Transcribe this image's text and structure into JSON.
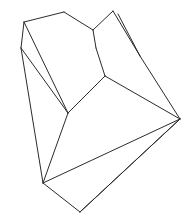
{
  "figure": {
    "type": "line-art",
    "canvas": {
      "width": 191,
      "height": 220,
      "background": "#ffffff"
    },
    "style": {
      "stroke_color": "#2b2b2b",
      "stroke_width": 1,
      "fill_color": "#ffffff",
      "has_text_labels": false,
      "has_shading": false
    },
    "vertices": {
      "top_left_peak": [
        24,
        22
      ],
      "left_shoulder": [
        21,
        48
      ],
      "top_mid_peak": [
        64,
        12
      ],
      "notch_junction": [
        93,
        30
      ],
      "notch_bottom": [
        96,
        48
      ],
      "top_right_peak": [
        113,
        11
      ],
      "sliver_inner": [
        118,
        14
      ],
      "mid_right_node": [
        105,
        76
      ],
      "right_apex": [
        180,
        119
      ],
      "center_node": [
        68,
        113
      ],
      "lower_left_node": [
        43,
        183
      ],
      "bottom_node": [
        80,
        212
      ],
      "inner_fold_a": [
        110,
        72
      ],
      "inner_fold_b": [
        140,
        56
      ]
    },
    "edges": [
      {
        "name": "top-left-ridge",
        "from": "top_left_peak",
        "to": "top_mid_peak"
      },
      {
        "name": "left-upper-fold",
        "from": "top_left_peak",
        "to": "left_shoulder"
      },
      {
        "name": "left-inner-fold",
        "from": "top_left_peak",
        "to": "center_node"
      },
      {
        "name": "upper-face-right",
        "from": "top_mid_peak",
        "to": "notch_junction"
      },
      {
        "name": "notch-left",
        "from": "notch_junction",
        "to": "notch_bottom"
      },
      {
        "name": "notch-right",
        "from": "notch_junction",
        "to": "top_right_peak"
      },
      {
        "name": "sliver-outer",
        "from": "top_right_peak",
        "to": "inner_fold_b"
      },
      {
        "name": "sliver-inner",
        "from": "sliver_inner",
        "to": "inner_fold_b"
      },
      {
        "name": "right-long-edge",
        "from": "inner_fold_b",
        "to": "right_apex"
      },
      {
        "name": "notch-down",
        "from": "notch_bottom",
        "to": "mid_right_node"
      },
      {
        "name": "mid-fold",
        "from": "mid_right_node",
        "to": "center_node"
      },
      {
        "name": "mid-to-apex",
        "from": "mid_right_node",
        "to": "right_apex"
      },
      {
        "name": "center-to-left-shoulder",
        "from": "center_node",
        "to": "left_shoulder"
      },
      {
        "name": "left-long-edge",
        "from": "left_shoulder",
        "to": "lower_left_node"
      },
      {
        "name": "center-to-lower-left",
        "from": "center_node",
        "to": "lower_left_node"
      },
      {
        "name": "lower-left-to-apex",
        "from": "lower_left_node",
        "to": "right_apex"
      },
      {
        "name": "lower-left-to-bottom",
        "from": "lower_left_node",
        "to": "bottom_node"
      },
      {
        "name": "bottom-to-apex",
        "from": "bottom_node",
        "to": "right_apex"
      }
    ]
  }
}
